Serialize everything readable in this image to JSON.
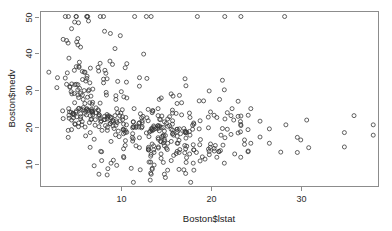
{
  "chart_data": {
    "type": "scatter",
    "title": "",
    "xlabel": "Boston$lstat",
    "ylabel": "Boston$medv",
    "xlim": [
      1.0,
      38.5
    ],
    "ylim": [
      4.0,
      51.5
    ],
    "xticks": [
      10,
      20,
      30
    ],
    "xtick_labels": [
      "10",
      "20",
      "30"
    ],
    "yticks": [
      10,
      20,
      30,
      40,
      50
    ],
    "ytick_labels": [
      "10",
      "20",
      "30",
      "40",
      "50"
    ],
    "grid": false,
    "legend": null,
    "marker": "open-circle",
    "marker_color": "#3a3a3a",
    "n_points": 506,
    "x": [
      4.98,
      9.14,
      4.03,
      2.94,
      5.33,
      5.21,
      12.43,
      19.15,
      29.93,
      17.1,
      20.45,
      13.27,
      15.71,
      8.26,
      10.26,
      8.47,
      6.58,
      14.67,
      11.69,
      11.28,
      21.02,
      13.83,
      18.72,
      19.88,
      16.3,
      16.51,
      14.81,
      17.28,
      12.8,
      11.98,
      22.6,
      13.04,
      27.71,
      18.35,
      20.34,
      9.68,
      11.41,
      8.77,
      10.13,
      4.32,
      1.98,
      4.84,
      5.81,
      7.44,
      9.55,
      10.21,
      14.15,
      18.8,
      30.81,
      16.2,
      13.45,
      9.43,
      5.28,
      8.43,
      14.8,
      4.81,
      5.77,
      3.95,
      6.86,
      9.22,
      13.15,
      14.44,
      6.73,
      9.5,
      8.05,
      4.67,
      10.24,
      8.1,
      13.09,
      8.79,
      6.72,
      9.88,
      5.52,
      7.54,
      6.78,
      8.94,
      11.97,
      10.27,
      12.34,
      9.1,
      5.29,
      7.22,
      6.72,
      7.51,
      9.62,
      6.53,
      12.86,
      8.44,
      5.5,
      5.7,
      8.81,
      8.2,
      8.16,
      6.21,
      10.59,
      6.65,
      11.34,
      4.21,
      3.57,
      6.19,
      9.42,
      7.67,
      10.63,
      13.44,
      12.33,
      16.47,
      18.66,
      14.09,
      12.27,
      15.55,
      13.0,
      10.16,
      16.21,
      17.09,
      10.45,
      15.76,
      12.04,
      10.3,
      15.37,
      13.61,
      14.37,
      14.27,
      17.93,
      25.41,
      17.58,
      14.81,
      14.69,
      11.28,
      22.19,
      15.02,
      15.7,
      14.1,
      23.29,
      17.16,
      24.39,
      15.69,
      14.52,
      21.52,
      24.08,
      17.64,
      19.69,
      12.03,
      16.22,
      15.17,
      23.27,
      18.05,
      26.45,
      34.77,
      37.97,
      13.44,
      23.24,
      21.24,
      23.69,
      21.78,
      17.19,
      16.22,
      29.55,
      9.32,
      13.51,
      16.71,
      22.98,
      5.0,
      6.29,
      11.5,
      8.49,
      11.44,
      12.8,
      9.97,
      6.85,
      7.69,
      9.78,
      8.47,
      9.84,
      12.14,
      10.51,
      8.34,
      7.6,
      6.41,
      5.9,
      10.63,
      12.5,
      7.44,
      8.76,
      6.08,
      5.98,
      10.02,
      3.81,
      8.05,
      6.36,
      5.99,
      9.04,
      5.39,
      5.03,
      12.03,
      4.8,
      4.15,
      3.8,
      6.86,
      8.31,
      5.91,
      5.72,
      4.28,
      5.21,
      4.84,
      6.2,
      8.9,
      5.04,
      4.7,
      3.51,
      6.0,
      7.79,
      4.5,
      4.24,
      6.27,
      4.69,
      4.18,
      6.15,
      8.37,
      5.68,
      8.68,
      6.84,
      9.45,
      5.79,
      6.44,
      9.91,
      7.69,
      5.37,
      5.03,
      4.5,
      4.86,
      6.07,
      4.52,
      5.5,
      5.27,
      4.54,
      4.47,
      5.33,
      5.21,
      4.65,
      4.79,
      7.14,
      5.27,
      5.51,
      5.95,
      6.06,
      6.57,
      6.84,
      7.11,
      6.29,
      6.77,
      7.5,
      5.52,
      4.45,
      4.12,
      4.5,
      4.86,
      5.2,
      8.05,
      6.59,
      5.19,
      6.22,
      5.07,
      6.38,
      4.32,
      5.32,
      5.08,
      2.87,
      5.03,
      3.95,
      4.9,
      5.29,
      7.22,
      6.72,
      7.51,
      9.62,
      6.53,
      12.86,
      8.44,
      5.5,
      5.7,
      8.81,
      8.2,
      8.16,
      6.21,
      10.59,
      6.65,
      11.34,
      4.21,
      3.57,
      6.19,
      9.42,
      7.67,
      10.63,
      13.44,
      12.33,
      16.47,
      18.66,
      14.09,
      12.27,
      15.55,
      13.0,
      10.16,
      16.21,
      17.09,
      10.45,
      15.76,
      12.04,
      10.3,
      15.37,
      13.61,
      14.37,
      14.27,
      17.93,
      25.41,
      17.58,
      14.81,
      14.69,
      11.28,
      22.19,
      15.02,
      15.7,
      14.1,
      23.29,
      17.16,
      24.39,
      15.69,
      14.52,
      21.52,
      24.08,
      17.64,
      19.69,
      12.03,
      16.22,
      15.17,
      23.27,
      18.05,
      26.45,
      34.77,
      37.97,
      13.44,
      23.24,
      21.24,
      23.69,
      21.78,
      17.19,
      16.22,
      29.55,
      9.32,
      13.51,
      16.71,
      22.98,
      19.92,
      17.28,
      21.45,
      16.59,
      28.28,
      21.08,
      18.76,
      19.67,
      20.62,
      22.31,
      11.65,
      15.69,
      11.34,
      22.49,
      20.92,
      30.59,
      35.84,
      21.5,
      23.29,
      28.14,
      13.33,
      18.46,
      13.03,
      13.04,
      17.06,
      15.12,
      20.85,
      16.43,
      18.0,
      17.21,
      15.56,
      19.31,
      15.83,
      13.45,
      14.8,
      13.1,
      17.16,
      21.45,
      14.43,
      21.3,
      24.1,
      13.66,
      13.61,
      17.6,
      13.65,
      19.78,
      16.42,
      17.72,
      14.91,
      13.23,
      13.34,
      13.28,
      15.16,
      13.44,
      11.36,
      19.01,
      14.45,
      11.24,
      14.24,
      10.45,
      4.13,
      9.38,
      10.48,
      8.45,
      7.54,
      13.28,
      14.68,
      11.12,
      16.96,
      14.13,
      20.32,
      18.07,
      19.77,
      10.3,
      18.07,
      8.88,
      7.84,
      9.14,
      7.01,
      6.56,
      10.27,
      8.88,
      14.13,
      17.26,
      7.73,
      9.51,
      8.53,
      12.12,
      16.1,
      13.27,
      14.1,
      22.98,
      19.92,
      18.76,
      20.62,
      11.65,
      13.33,
      13.03,
      17.06,
      20.85,
      18.0,
      15.56,
      15.83,
      14.8,
      17.16,
      14.43,
      24.1,
      13.61,
      13.65,
      16.42,
      14.91,
      13.34,
      15.16,
      11.36,
      14.45,
      14.24,
      4.13,
      10.48,
      7.54,
      14.68,
      16.96,
      20.32,
      19.77,
      18.07,
      7.84,
      7.01,
      10.27,
      14.13,
      7.73,
      8.53,
      16.1,
      14.1,
      9.08,
      5.64,
      6.48,
      7.88
    ],
    "y": [
      24.0,
      21.6,
      34.7,
      33.4,
      36.2,
      28.7,
      22.9,
      27.1,
      16.5,
      18.9,
      15.0,
      18.9,
      21.7,
      20.4,
      18.2,
      19.9,
      23.1,
      17.5,
      20.2,
      18.2,
      13.6,
      19.6,
      15.2,
      14.5,
      15.6,
      13.9,
      16.6,
      14.8,
      18.4,
      21.0,
      12.7,
      14.5,
      13.2,
      13.1,
      13.5,
      18.9,
      20.0,
      21.0,
      24.7,
      30.8,
      34.9,
      26.6,
      25.3,
      24.7,
      21.2,
      19.3,
      20.0,
      16.6,
      14.4,
      19.4,
      19.7,
      20.5,
      25.0,
      23.4,
      18.9,
      35.4,
      24.7,
      31.6,
      23.3,
      19.6,
      18.7,
      16.0,
      22.2,
      25.0,
      33.0,
      23.5,
      19.4,
      22.0,
      17.4,
      20.9,
      24.2,
      21.7,
      22.8,
      23.4,
      24.1,
      21.4,
      20.0,
      20.8,
      21.2,
      20.3,
      28.0,
      23.9,
      24.8,
      22.9,
      23.9,
      26.6,
      22.5,
      22.2,
      23.6,
      28.7,
      22.6,
      22.0,
      22.9,
      25.0,
      20.6,
      28.4,
      21.4,
      38.7,
      43.8,
      33.2,
      27.5,
      26.5,
      18.6,
      19.3,
      20.1,
      19.5,
      19.5,
      20.4,
      19.8,
      19.4,
      21.7,
      22.8,
      18.8,
      18.7,
      18.5,
      18.3,
      21.2,
      19.2,
      20.4,
      19.3,
      22.0,
      20.3,
      20.5,
      17.3,
      18.8,
      21.4,
      15.7,
      16.2,
      18.0,
      14.3,
      19.2,
      19.6,
      23.0,
      18.4,
      15.6,
      18.1,
      17.4,
      17.1,
      13.3,
      17.8,
      14.0,
      14.4,
      13.4,
      15.6,
      11.8,
      13.8,
      15.6,
      14.6,
      17.8,
      15.4,
      21.5,
      19.6,
      15.3,
      19.4,
      17.0,
      15.6,
      13.1,
      41.3,
      24.3,
      23.3,
      27.0,
      50.0,
      50.0,
      50.0,
      22.7,
      25.0,
      50.0,
      23.8,
      23.8,
      22.3,
      17.4,
      19.1,
      23.1,
      23.6,
      22.6,
      29.4,
      23.2,
      24.6,
      29.9,
      37.2,
      39.8,
      36.2,
      37.9,
      32.5,
      26.4,
      29.6,
      50.0,
      32.0,
      29.8,
      34.9,
      37.0,
      30.5,
      36.4,
      31.1,
      29.1,
      50.0,
      33.3,
      30.3,
      34.6,
      34.9,
      32.9,
      24.1,
      42.3,
      48.5,
      50.0,
      22.6,
      24.4,
      22.5,
      24.4,
      20.0,
      21.7,
      19.3,
      22.4,
      28.1,
      23.7,
      25.0,
      23.3,
      28.7,
      21.5,
      23.0,
      26.7,
      21.7,
      27.5,
      30.1,
      44.8,
      50.0,
      37.6,
      31.6,
      46.7,
      31.5,
      24.3,
      31.7,
      41.7,
      48.3,
      29.0,
      24.0,
      25.1,
      31.5,
      23.7,
      23.3,
      22.0,
      20.1,
      22.2,
      23.7,
      17.6,
      18.5,
      24.3,
      20.5,
      24.5,
      26.2,
      24.4,
      24.8,
      29.6,
      42.8,
      21.9,
      20.9,
      44.0,
      50.0,
      36.0,
      30.1,
      33.8,
      43.1,
      48.8,
      31.0,
      36.5,
      22.8,
      30.7,
      50.0,
      43.5,
      20.7,
      21.1,
      25.2,
      24.4,
      35.2,
      32.4,
      32.0,
      33.2,
      33.1,
      29.1,
      35.1,
      45.4,
      35.4,
      46.0,
      50.0,
      32.2,
      22.0,
      20.1,
      23.2,
      22.3,
      24.8,
      28.5,
      37.3,
      27.9,
      23.9,
      21.7,
      28.6,
      27.1,
      20.3,
      22.5,
      29.0,
      24.8,
      22.0,
      26.4,
      33.1,
      36.1,
      28.4,
      33.4,
      28.2,
      22.8,
      20.3,
      16.1,
      22.1,
      19.4,
      21.6,
      23.8,
      16.2,
      17.8,
      19.8,
      23.1,
      21.0,
      23.8,
      23.1,
      20.4,
      18.5,
      25.0,
      24.6,
      23.0,
      22.2,
      19.3,
      22.6,
      19.8,
      17.1,
      19.4,
      22.2,
      20.7,
      21.1,
      19.5,
      18.5,
      20.6,
      19.0,
      18.7,
      32.7,
      16.5,
      23.9,
      31.2,
      17.5,
      17.2,
      23.1,
      24.5,
      26.6,
      22.9,
      24.1,
      18.6,
      30.1,
      18.2,
      20.6,
      17.8,
      21.7,
      22.7,
      22.6,
      25.0,
      19.9,
      20.8,
      16.8,
      21.9,
      27.5,
      21.9,
      23.1,
      50.0,
      50.0,
      50.0,
      50.0,
      50.0,
      13.8,
      13.8,
      15.0,
      13.9,
      13.3,
      13.1,
      10.2,
      10.4,
      10.9,
      11.3,
      12.3,
      8.8,
      7.2,
      10.5,
      7.4,
      10.2,
      11.5,
      15.1,
      23.2,
      9.7,
      13.8,
      12.7,
      13.1,
      12.5,
      8.5,
      5.0,
      6.3,
      5.6,
      7.2,
      12.1,
      8.3,
      8.5,
      5.0,
      11.9,
      27.9,
      17.2,
      27.5,
      15.0,
      17.2,
      17.9,
      16.3,
      7.0,
      7.2,
      7.5,
      10.4,
      8.8,
      8.4,
      16.7,
      14.2,
      20.8,
      13.4,
      11.7,
      8.3,
      10.2,
      10.9,
      11.0,
      9.5,
      14.5,
      14.1,
      16.1,
      14.3,
      11.7,
      13.4,
      9.6,
      8.7,
      8.4,
      12.8,
      10.5,
      17.1,
      18.4,
      15.4,
      10.8,
      11.8,
      14.9,
      12.6,
      14.1,
      13.0,
      13.4,
      15.2,
      16.1,
      17.8,
      14.9,
      14.1,
      12.7,
      13.5,
      14.9,
      20.0,
      16.4,
      17.7,
      19.5,
      20.2,
      21.4,
      19.9,
      19.0,
      19.1,
      19.1,
      20.1,
      19.9,
      19.6,
      23.2,
      29.8,
      13.8,
      13.3,
      16.7,
      12.0,
      14.6,
      21.4,
      23.0,
      23.7,
      25.0,
      21.8,
      20.6,
      21.2,
      19.1,
      20.6,
      15.2,
      7.0,
      8.1,
      13.6,
      20.1,
      21.8,
      24.5,
      23.1,
      19.7,
      18.3,
      21.2,
      17.5,
      16.8,
      22.4,
      20.6,
      23.9,
      22.0,
      11.9
    ]
  },
  "plot_geometry": {
    "frame_left": 40,
    "frame_right": 378,
    "frame_top": 11,
    "frame_bottom": 186,
    "point_radius": 2.0
  },
  "axis_labels": {
    "x_title": "Boston$lstat",
    "y_title": "Boston$medv"
  }
}
